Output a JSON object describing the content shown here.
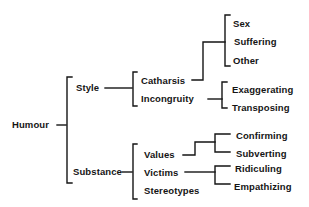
{
  "diagram": {
    "type": "tree",
    "root": "Humour",
    "branches": [
      {
        "label": "Style",
        "children": [
          {
            "label": "Catharsis",
            "children": [
              "Sex",
              "Suffering",
              "Other"
            ]
          },
          {
            "label": "Incongruity",
            "children": [
              "Exaggerating",
              "Transposing"
            ]
          }
        ]
      },
      {
        "label": "Substance",
        "children": [
          {
            "label": "Values",
            "children": [
              "Confirming",
              "Subverting"
            ]
          },
          {
            "label": "Victims",
            "children": [
              "Ridiculing",
              "Empathizing"
            ]
          },
          {
            "label": "Stereotypes",
            "children": []
          }
        ]
      }
    ]
  },
  "labels": {
    "humour": "Humour",
    "style": "Style",
    "substance": "Substance",
    "catharsis": "Catharsis",
    "incongruity": "Incongruity",
    "sex": "Sex",
    "suffering": "Suffering",
    "other": "Other",
    "exaggerating": "Exaggerating",
    "transposing": "Transposing",
    "values": "Values",
    "victims": "Victims",
    "stereotypes": "Stereotypes",
    "confirming": "Confirming",
    "subverting": "Subverting",
    "ridiculing": "Ridiculing",
    "empathizing": "Empathizing"
  },
  "colors": {
    "ink": "#151515",
    "background": "#ffffff"
  }
}
